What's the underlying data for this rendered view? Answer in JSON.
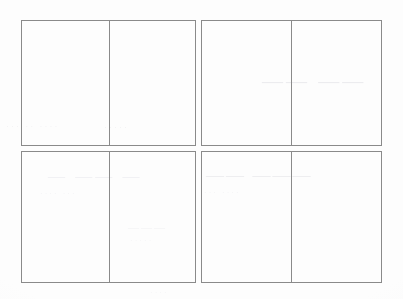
{
  "document": {
    "kind": "scanned-page",
    "description": "Blank scanned form sheet with a 2x2 arrangement of bordered blocks, each split into two cells",
    "background_color": "#fdfdfd",
    "border_color": "#8a8a8a",
    "ghost_color": "#e9e9ec"
  },
  "grid": {
    "rows": 2,
    "columns": 2,
    "cells_per_block": 2,
    "blocks": [
      {
        "id": "top-left",
        "name": "block-top-left",
        "cells": [
          {
            "id": "top-left-a",
            "text": ""
          },
          {
            "id": "top-left-b",
            "text": ""
          }
        ]
      },
      {
        "id": "top-right",
        "name": "block-top-right",
        "cells": [
          {
            "id": "top-right-a",
            "text": ""
          },
          {
            "id": "top-right-b",
            "text": ""
          }
        ]
      },
      {
        "id": "bottom-left",
        "name": "block-bottom-left",
        "cells": [
          {
            "id": "bottom-left-a",
            "text": ""
          },
          {
            "id": "bottom-left-b",
            "text": ""
          }
        ]
      },
      {
        "id": "bottom-right",
        "name": "block-bottom-right",
        "cells": [
          {
            "id": "bottom-right-a",
            "text": ""
          },
          {
            "id": "bottom-right-b",
            "text": ""
          }
        ]
      }
    ]
  },
  "ghost_marks": {
    "note": "Illegible bleed-through from the reverse side of the sheet; no readable characters",
    "top_right": "—— ——",
    "mid_left": "··· ·· ····",
    "mid_left_2": "·····",
    "row2_left": "— —— —",
    "row2_left_2": "···· ···",
    "row2_right": "—— ———",
    "row2_right_2": "··· ····",
    "bottom_mid": "———",
    "bottom_mid_2": "·····",
    "footer": "····"
  }
}
